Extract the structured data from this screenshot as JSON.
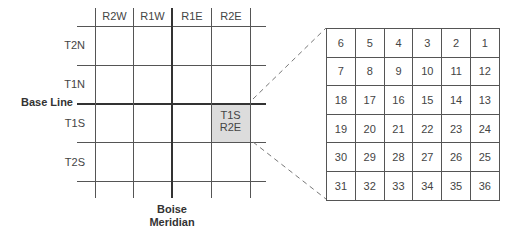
{
  "township_grid": {
    "range_labels": [
      "R2W",
      "R1W",
      "R1E",
      "R2E"
    ],
    "township_labels": [
      "T2N",
      "T1N",
      "T1S",
      "T2S"
    ],
    "base_line_label": "Base Line",
    "meridian_label_line1": "Boise",
    "meridian_label_line2": "Meridian",
    "highlighted_cell": {
      "line1": "T1S",
      "line2": "R2E",
      "fill": "#dcdcdc"
    }
  },
  "section_grid": {
    "rows": [
      [
        "6",
        "5",
        "4",
        "3",
        "2",
        "1"
      ],
      [
        "7",
        "8",
        "9",
        "10",
        "11",
        "12"
      ],
      [
        "18",
        "17",
        "16",
        "15",
        "14",
        "13"
      ],
      [
        "19",
        "20",
        "21",
        "22",
        "23",
        "24"
      ],
      [
        "30",
        "29",
        "28",
        "27",
        "26",
        "25"
      ],
      [
        "31",
        "32",
        "33",
        "34",
        "35",
        "36"
      ]
    ]
  }
}
